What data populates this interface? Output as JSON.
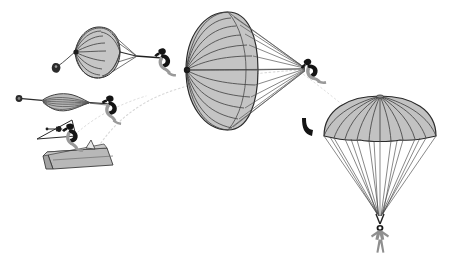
{
  "figure": {
    "background_color": "#ffffff",
    "canopy_fill": "#bdbdbd",
    "canopy_fill_light": "#cfcfcf",
    "line_color": "#3a3a3a",
    "outline_color": "#1a1a1a",
    "figure_fill": "#9a9a9a",
    "figure_dark": "#141414",
    "trajectory_color": "#d2d2d2",
    "platform_fill": "#b5b5b5",
    "platform_fill_dark": "#9d9d9d"
  },
  "stages": [
    {
      "id": "stage-1-exit",
      "name": "exit-from-platform",
      "center_x": 78,
      "center_y": 148,
      "description": "Jumper exiting ramp with deployment bag"
    },
    {
      "id": "stage-2-streamer",
      "name": "pilot-chute-streaming",
      "center_x": 62,
      "center_y": 103,
      "description": "Pilot chute extracts folded canopy in a streamer"
    },
    {
      "id": "stage-3-inflating",
      "name": "canopy-partially-inflated",
      "center_x": 88,
      "center_y": 52,
      "description": "Canopy beginning to inflate, gores opening"
    },
    {
      "id": "stage-4-full",
      "name": "canopy-fully-inflated-side",
      "center_x": 230,
      "center_y": 72,
      "description": "Canopy fully inflated seen from the side with suspension lines"
    },
    {
      "id": "stage-5-descent",
      "name": "canopy-steady-descent",
      "center_x": 380,
      "center_y": 170,
      "description": "Steady descent under fully inflated canopy"
    }
  ],
  "elements": {
    "platform_label": "launch-platform",
    "cone_label": "deployment-cone",
    "pilot_chute_label": "pilot-chute",
    "hook_label": "risers-hook",
    "jumper_label": "skydiver-figure",
    "canopy_label": "canopy",
    "suspension_lines_label": "suspension-lines",
    "trajectory_label": "flight-path"
  },
  "counts": {
    "big_canopy_gores": 13,
    "big_canopy_lines": 15,
    "right_canopy_gores": 12,
    "right_canopy_lines": 16,
    "small_canopy_gores": 11
  }
}
